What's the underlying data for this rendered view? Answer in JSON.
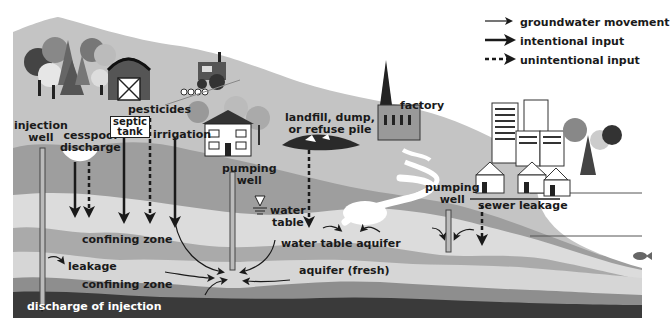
{
  "legend": {
    "items": [
      {
        "label": "groundwater movement",
        "style": "thin-solid"
      },
      {
        "label": "intentional input",
        "style": "thick-solid"
      },
      {
        "label": "unintentional input",
        "style": "dashed"
      }
    ]
  },
  "labels": {
    "injection_well": [
      "injection",
      "well"
    ],
    "cesspool_discharge": [
      "cesspool",
      "discharge"
    ],
    "septic_tank": [
      "septic",
      "tank"
    ],
    "pesticides": "pesticides",
    "irrigation": "irrigation",
    "pumping_well_left": [
      "pumping",
      "well"
    ],
    "water_table": [
      "water",
      "table"
    ],
    "landfill": [
      "landfill, dump,",
      "or refuse pile"
    ],
    "factory": "factory",
    "pumping_well_right": [
      "pumping",
      "well"
    ],
    "sewer_leakage": "sewer leakage",
    "confining_zone_upper": "confining zone",
    "water_table_aquifer": "water table aquifer",
    "leakage": "leakage",
    "aquifer_fresh": "aquifer (fresh)",
    "confining_zone_lower": "confining zone",
    "discharge_of_injection": "discharge of injection"
  },
  "colors": {
    "sky": "#ffffff",
    "land_surface": "#c2c2c2",
    "unsaturated_band": "#9a9a9a",
    "water_table_aquifer": "#dcdcdc",
    "confining_zone": "#a8a8a8",
    "aquifer_fresh": "#d6d6d6",
    "deep_confining": "#8c8c8c",
    "bedrock": "#3a3a3a",
    "water_body": "#ffffff",
    "ink": "#1a1a1a"
  }
}
